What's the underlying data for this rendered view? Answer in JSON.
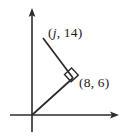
{
  "figure": {
    "background_color": "#ffffff",
    "line_color": "#2b2b2b",
    "text_color": "#1b1b1b",
    "axes": {
      "x_axis_name": "x-axis",
      "y_axis_name": "y-axis",
      "origin": {
        "x": 32,
        "y": 115
      },
      "x_axis": {
        "x1": 10,
        "y1": 115,
        "x2": 115,
        "y2": 115,
        "arrow": "right"
      },
      "y_axis": {
        "x1": 32,
        "y1": 132,
        "x2": 32,
        "y2": 11,
        "arrow": "up"
      }
    },
    "segments": [
      {
        "name": "segment-origin-to-vertex",
        "from": {
          "x": 32,
          "y": 115
        },
        "to": {
          "x": 73,
          "y": 78
        }
      },
      {
        "name": "segment-vertex-to-top-point",
        "from": {
          "x": 73,
          "y": 78
        },
        "to": {
          "x": 43,
          "y": 38
        }
      }
    ],
    "right_angle": {
      "name": "right-angle-marker",
      "at_vertex": {
        "x": 73,
        "y": 78
      },
      "measure": "90 degrees"
    },
    "labels": {
      "top_point": {
        "text": "(j, 14)",
        "open_paren": "(",
        "variable": "j",
        "separator": ", ",
        "y_value": "14",
        "close_paren": ")"
      },
      "right_point": {
        "text": "(8, 6)",
        "open_paren": "(",
        "x_value": "8",
        "separator": ", ",
        "y_value": "6",
        "close_paren": ")"
      }
    }
  }
}
